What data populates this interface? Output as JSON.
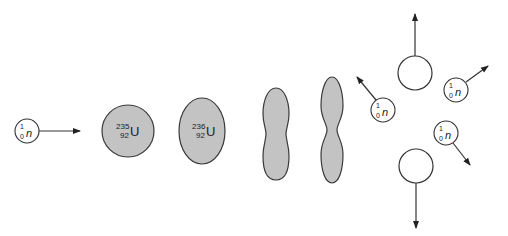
{
  "diagram": {
    "title": "",
    "colors": {
      "nucleus_fill": "#c3c3c3",
      "outline": "#333333",
      "background": "#ffffff"
    },
    "incoming_neutron": {
      "mass_number": "1",
      "atomic_number": "0",
      "symbol": "n"
    },
    "uranium_235": {
      "mass_number": "235",
      "atomic_number": "92",
      "symbol": "U"
    },
    "uranium_236": {
      "mass_number": "236",
      "atomic_number": "92",
      "symbol": "U"
    },
    "released_neutrons": [
      {
        "mass_number": "1",
        "atomic_number": "0",
        "symbol": "n"
      },
      {
        "mass_number": "1",
        "atomic_number": "0",
        "symbol": "n"
      },
      {
        "mass_number": "1",
        "atomic_number": "0",
        "symbol": "n"
      }
    ],
    "stages": [
      "incoming-neutron",
      "uranium-235-nucleus",
      "uranium-236-compound-nucleus",
      "elongating-nucleus",
      "necking-nucleus",
      "fission-fragments-and-neutrons"
    ]
  }
}
